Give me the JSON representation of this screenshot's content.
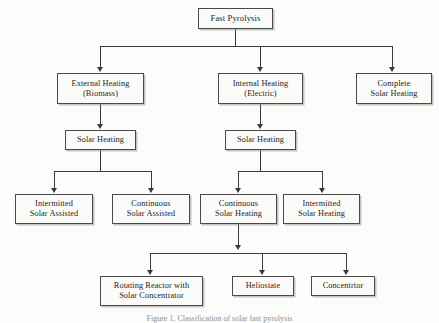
{
  "figure": {
    "caption": "Figure 1. Classification of solar fast pyrolysis",
    "colors": {
      "background": "#fcfcfa",
      "box_fill": "#fbfbf9",
      "box_border": "#4a4a4a",
      "connector": "#3a3a3a",
      "text": "#1d1d1d"
    }
  },
  "nodes": {
    "root": "Fast Pyrolysis",
    "level2": {
      "external": "External Heating\n(Biomass)",
      "internal": "Internal Heating\n(Electric)",
      "complete": "Complete\nSolar Heating"
    },
    "level3": {
      "left_solar": "Solar Heating",
      "right_solar": "Solar Heating"
    },
    "level4": {
      "intermitted_assisted": "Intermitted\nSolar Assisted",
      "continuous_assisted": "Continuous\nSolar Assisted",
      "continuous_heating": "Continuous\nSolar Heating",
      "intermitted_heating": "Intermitted\nSolar Heating"
    },
    "level5": {
      "rotating_reactor": "Rotating Reactor with\nSolar Concentrator",
      "heliostate": "Heliostate",
      "concentrtor": "Concentrtor"
    }
  }
}
